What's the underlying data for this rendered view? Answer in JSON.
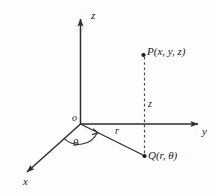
{
  "figure": {
    "kind": "cylindrical-coordinates-diagram",
    "background_color": "#fdfdfd",
    "stroke_color": "#333333",
    "text_color": "#1a1a1a"
  },
  "axes": {
    "z_label": "z",
    "y_label": "y",
    "x_label": "x",
    "origin_label": "o"
  },
  "points": {
    "p_label": "P(x, y, z)",
    "q_label": "Q(r, θ)"
  },
  "annotations": {
    "radius_label": "r",
    "height_label": "z",
    "angle_label": "θ"
  }
}
